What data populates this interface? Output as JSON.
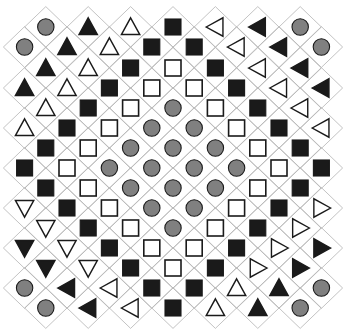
{
  "figure": {
    "type": "shape-lattice-grid",
    "width": 346,
    "height": 332,
    "background_color": "#ffffff",
    "cell_outline_color": "#b4b4b4",
    "cell_outline_width": 0.8,
    "cell_half_width": 21.2,
    "cell_half_height": 20.4,
    "origin_x": 173,
    "origin_y": 166,
    "shape_colors": {
      "black": "#1a1a1a",
      "gray": "#808080",
      "white": "#ffffff",
      "outline": "#1a1a1a"
    },
    "shape_legend": [
      {
        "key": "gray-circle",
        "label": "Gray filled circle"
      },
      {
        "key": "black-square",
        "label": "Black filled square"
      },
      {
        "key": "white-square",
        "label": "White square with black outline"
      },
      {
        "key": "black-up-triangle",
        "label": "Black filled up triangle"
      },
      {
        "key": "white-up-triangle",
        "label": "White up triangle with black outline"
      },
      {
        "key": "black-down-triangle",
        "label": "Black filled down triangle"
      },
      {
        "key": "white-down-triangle",
        "label": "White down triangle with black outline"
      },
      {
        "key": "black-left-triangle",
        "label": "Black filled left triangle"
      },
      {
        "key": "white-left-triangle",
        "label": "White left triangle with black outline"
      },
      {
        "key": "black-right-triangle",
        "label": "Black filled right triangle"
      },
      {
        "key": "white-right-triangle",
        "label": "White right triangle with black outline"
      }
    ]
  },
  "chart_data": {
    "type": "heatmap",
    "xlabel": "",
    "ylabel": "",
    "rows": 15,
    "row_counts": [
      7,
      8,
      7,
      8,
      7,
      8,
      7,
      8,
      7,
      8,
      7,
      8,
      7,
      8,
      7
    ],
    "grid": true,
    "legend": "none",
    "row_y": [
      27,
      47,
      68,
      88,
      108,
      128,
      148,
      168,
      188,
      208,
      228,
      248,
      268,
      288,
      308
    ],
    "cells": [
      [
        "gray-circle",
        "black-up-triangle",
        "white-up-triangle",
        "black-square",
        "white-left-triangle",
        "black-left-triangle",
        "gray-circle"
      ],
      [
        "gray-circle",
        "black-up-triangle",
        "white-up-triangle",
        "black-square",
        "black-square",
        "white-left-triangle",
        "black-left-triangle",
        "gray-circle"
      ],
      [
        "black-up-triangle",
        "white-up-triangle",
        "black-square",
        "white-square",
        "black-square",
        "white-left-triangle",
        "black-left-triangle"
      ],
      [
        "black-up-triangle",
        "white-up-triangle",
        "black-square",
        "white-square",
        "white-square",
        "black-square",
        "white-left-triangle",
        "black-left-triangle"
      ],
      [
        "white-up-triangle",
        "black-square",
        "white-square",
        "gray-circle",
        "white-square",
        "black-square",
        "white-left-triangle"
      ],
      [
        "white-up-triangle",
        "black-square",
        "white-square",
        "gray-circle",
        "gray-circle",
        "white-square",
        "black-square",
        "white-left-triangle"
      ],
      [
        "black-square",
        "white-square",
        "gray-circle",
        "gray-circle",
        "gray-circle",
        "white-square",
        "black-square"
      ],
      [
        "black-square",
        "white-square",
        "gray-circle",
        "gray-circle",
        "gray-circle",
        "gray-circle",
        "white-square",
        "black-square"
      ],
      [
        "black-square",
        "white-square",
        "gray-circle",
        "gray-circle",
        "gray-circle",
        "white-square",
        "black-square"
      ],
      [
        "white-down-triangle",
        "black-square",
        "white-square",
        "gray-circle",
        "gray-circle",
        "white-square",
        "black-square",
        "white-right-triangle"
      ],
      [
        "white-down-triangle",
        "black-square",
        "white-square",
        "gray-circle",
        "white-square",
        "black-square",
        "white-right-triangle"
      ],
      [
        "black-down-triangle",
        "white-down-triangle",
        "black-square",
        "white-square",
        "white-square",
        "black-square",
        "white-right-triangle",
        "black-right-triangle"
      ],
      [
        "black-down-triangle",
        "white-down-triangle",
        "black-square",
        "white-square",
        "black-square",
        "white-right-triangle",
        "black-right-triangle"
      ],
      [
        "gray-circle",
        "black-left-triangle",
        "white-left-triangle",
        "black-square",
        "black-square",
        "white-up-triangle",
        "black-up-triangle",
        "gray-circle"
      ],
      [
        "gray-circle",
        "black-left-triangle",
        "white-left-triangle",
        "black-square",
        "white-up-triangle",
        "black-up-triangle",
        "gray-circle"
      ]
    ]
  }
}
